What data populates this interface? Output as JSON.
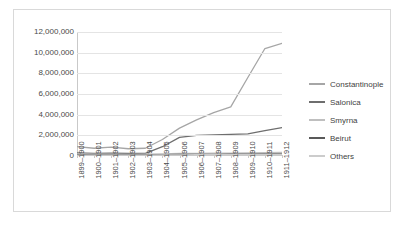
{
  "chart_data": {
    "type": "line",
    "title": "",
    "xlabel": "",
    "ylabel": "",
    "ylim": [
      0,
      12000000
    ],
    "ytick_labels": [
      "12,000,000",
      "10,000,000",
      "8,000,000",
      "6,000,000",
      "4,000,000",
      "2,000,000",
      "0"
    ],
    "ytick_values": [
      12000000,
      10000000,
      8000000,
      6000000,
      4000000,
      2000000,
      0
    ],
    "grid": true,
    "legend_position": "right",
    "categories": [
      "1899–1900",
      "1900–1901",
      "1901–1902",
      "1902–1903",
      "1903–1904",
      "1904–1905",
      "1905–1906",
      "1906–1907",
      "1907–1908",
      "1908–1909",
      "1909–1910",
      "1910–1911",
      "1911–1912"
    ],
    "series": [
      {
        "name": "Constantinople",
        "color": "#a6a6a6",
        "values": [
          900000,
          750000,
          850000,
          700000,
          750000,
          1600000,
          2700000,
          3500000,
          4200000,
          4750000,
          7600000,
          10400000,
          10900000
        ]
      },
      {
        "name": "Salonica",
        "color": "#6e6e6e",
        "values": [
          300000,
          260000,
          280000,
          250000,
          260000,
          900000,
          1800000,
          2000000,
          2050000,
          2100000,
          2150000,
          2450000,
          2750000
        ]
      },
      {
        "name": "Smyrna",
        "color": "#bfbfbf",
        "values": [
          180000,
          170000,
          175000,
          165000,
          170000,
          200000,
          240000,
          260000,
          270000,
          280000,
          300000,
          330000,
          360000
        ]
      },
      {
        "name": "Beirut",
        "color": "#595959",
        "values": [
          120000,
          115000,
          118000,
          110000,
          112000,
          130000,
          150000,
          160000,
          165000,
          170000,
          180000,
          200000,
          220000
        ]
      },
      {
        "name": "Others",
        "color": "#cccccc",
        "values": [
          90000,
          85000,
          88000,
          82000,
          85000,
          95000,
          110000,
          120000,
          125000,
          130000,
          140000,
          155000,
          170000
        ]
      }
    ]
  }
}
